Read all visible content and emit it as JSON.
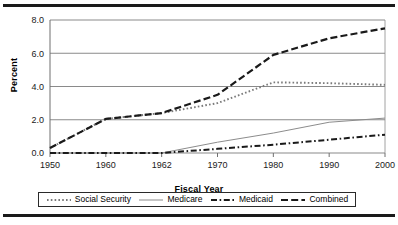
{
  "figure": {
    "name": "fiscal-year-percent-line-chart"
  },
  "chart_data": {
    "type": "line",
    "title": "",
    "xlabel": "Fiscal Year",
    "ylabel": "Percent",
    "categories": [
      "1950",
      "1960",
      "1962",
      "1970",
      "1980",
      "1990",
      "2000"
    ],
    "yticks": [
      "0.0",
      "2.0",
      "4.0",
      "6.0",
      "8.0"
    ],
    "ylim": [
      0.0,
      8.0
    ],
    "grid": "horizontal",
    "legend_position": "bottom",
    "series": [
      {
        "name": "Social Security",
        "style": "dotted",
        "color": "#7a7a7a",
        "values": [
          0.3,
          2.05,
          2.4,
          3.0,
          4.25,
          4.2,
          4.1
        ]
      },
      {
        "name": "Medicare",
        "style": "solid",
        "color": "#8c8c8c",
        "values": [
          0.0,
          0.0,
          0.0,
          0.65,
          1.2,
          1.85,
          2.1
        ]
      },
      {
        "name": "Medicaid",
        "style": "dash-dot",
        "color": "#1a1a1a",
        "values": [
          0.0,
          0.0,
          0.0,
          0.25,
          0.5,
          0.8,
          1.1
        ]
      },
      {
        "name": "Combined",
        "style": "dashed",
        "color": "#1a1a1a",
        "values": [
          0.3,
          2.05,
          2.4,
          3.5,
          5.9,
          6.9,
          7.5
        ]
      }
    ]
  },
  "legend": {
    "items": [
      {
        "label": "Social Security"
      },
      {
        "label": "Medicare"
      },
      {
        "label": "Medicaid"
      },
      {
        "label": "Combined"
      }
    ]
  }
}
